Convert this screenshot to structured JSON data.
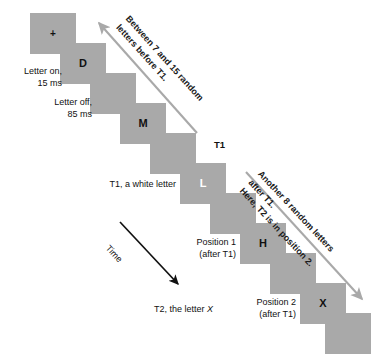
{
  "figure": {
    "type": "rsvp-attentional-blink-diagram",
    "background_color": "#ffffff",
    "frame_color": "#a9a9a9",
    "arrow_gray_color": "#a9a9a9",
    "arrow_black_color": "#111111"
  },
  "frames": [
    {
      "id": "frame-1",
      "glyph": "+",
      "glyph_color": "black",
      "is_fixation": true,
      "x": 30,
      "y": 13
    },
    {
      "id": "frame-2",
      "glyph": "D",
      "glyph_color": "black",
      "is_fixation": false,
      "x": 60,
      "y": 43
    },
    {
      "id": "frame-3",
      "glyph": "",
      "glyph_color": "black",
      "is_fixation": false,
      "x": 90,
      "y": 73
    },
    {
      "id": "frame-4",
      "glyph": "M",
      "glyph_color": "black",
      "is_fixation": false,
      "x": 120,
      "y": 103
    },
    {
      "id": "frame-5",
      "glyph": "",
      "glyph_color": "black",
      "is_fixation": false,
      "x": 150,
      "y": 133
    },
    {
      "id": "frame-6",
      "glyph": "L",
      "glyph_color": "white",
      "is_fixation": false,
      "x": 180,
      "y": 163
    },
    {
      "id": "frame-7",
      "glyph": "",
      "glyph_color": "black",
      "is_fixation": false,
      "x": 210,
      "y": 193
    },
    {
      "id": "frame-8",
      "glyph": "H",
      "glyph_color": "black",
      "is_fixation": false,
      "x": 240,
      "y": 223
    },
    {
      "id": "frame-9",
      "glyph": "",
      "glyph_color": "black",
      "is_fixation": false,
      "x": 270,
      "y": 253
    },
    {
      "id": "frame-10",
      "glyph": "X",
      "glyph_color": "black",
      "is_fixation": false,
      "x": 300,
      "y": 283
    },
    {
      "id": "frame-11",
      "glyph": "",
      "glyph_color": "black",
      "is_fixation": false,
      "x": 325,
      "y": 313
    }
  ],
  "captions": {
    "letter_on": "Letter on,\n15 ms",
    "letter_off": "Letter off,\n85 ms",
    "t1_white_letter": "T1, a white letter",
    "t1_marker": "T1",
    "position_1": "Position 1\n(after T1)",
    "position_2": "Position 2\n(after T1)",
    "t2_letter_prefix": "T2, the letter ",
    "t2_letter_glyph": "X"
  },
  "annotations": {
    "before_t1": "Between 7 and 15 random\nletters before T1.",
    "after_t1": "Another 8 random letters after T1.\nHere, T2 is in position 2.",
    "time_label": "Time"
  }
}
